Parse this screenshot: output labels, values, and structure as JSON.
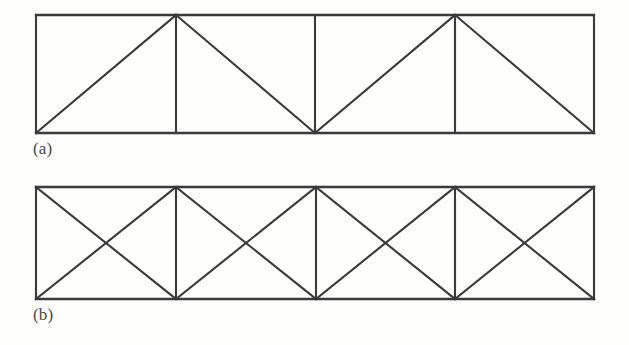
{
  "figure": {
    "background_color": "#fdfdfc",
    "line_color": "#3a3a3a",
    "line_width": 2.1,
    "caption_color": "#4a4a4a"
  },
  "diagrams": [
    {
      "id": "a",
      "caption": "(a)",
      "name": "warren-truss-with-verticals",
      "geometry": {
        "left": 36,
        "right": 594,
        "top": 15,
        "bottom": 133,
        "verticals_x": [
          176,
          315,
          455
        ],
        "panel_count": 4
      },
      "members": {
        "top_chord": [
          [
            36,
            15
          ],
          [
            594,
            15
          ]
        ],
        "bottom_chord": [
          [
            36,
            133
          ],
          [
            594,
            133
          ]
        ],
        "left_end_post": [
          [
            36,
            15
          ],
          [
            36,
            133
          ]
        ],
        "right_end_post": [
          [
            594,
            15
          ],
          [
            594,
            133
          ]
        ],
        "verticals": [
          [
            [
              176,
              15
            ],
            [
              176,
              133
            ]
          ],
          [
            [
              315,
              15
            ],
            [
              315,
              133
            ]
          ],
          [
            [
              455,
              15
            ],
            [
              455,
              133
            ]
          ]
        ],
        "diagonals": [
          [
            [
              36,
              133
            ],
            [
              176,
              15
            ]
          ],
          [
            [
              176,
              15
            ],
            [
              315,
              133
            ]
          ],
          [
            [
              315,
              133
            ],
            [
              455,
              15
            ]
          ],
          [
            [
              455,
              15
            ],
            [
              594,
              133
            ]
          ]
        ]
      }
    },
    {
      "id": "b",
      "caption": "(b)",
      "name": "cross-braced-truss",
      "geometry": {
        "left": 36,
        "right": 594,
        "top": 187,
        "bottom": 299,
        "verticals_x": [
          176,
          316,
          455
        ],
        "panel_count": 4
      },
      "members": {
        "top_chord": [
          [
            36,
            187
          ],
          [
            594,
            187
          ]
        ],
        "bottom_chord": [
          [
            36,
            299
          ],
          [
            594,
            299
          ]
        ],
        "left_end_post": [
          [
            36,
            187
          ],
          [
            36,
            299
          ]
        ],
        "right_end_post": [
          [
            594,
            187
          ],
          [
            594,
            299
          ]
        ],
        "verticals": [
          [
            [
              176,
              187
            ],
            [
              176,
              299
            ]
          ],
          [
            [
              316,
              187
            ],
            [
              316,
              299
            ]
          ],
          [
            [
              455,
              187
            ],
            [
              455,
              299
            ]
          ]
        ],
        "diagonals": [
          [
            [
              36,
              187
            ],
            [
              176,
              299
            ]
          ],
          [
            [
              36,
              299
            ],
            [
              176,
              187
            ]
          ],
          [
            [
              176,
              187
            ],
            [
              316,
              299
            ]
          ],
          [
            [
              176,
              299
            ],
            [
              316,
              187
            ]
          ],
          [
            [
              316,
              187
            ],
            [
              455,
              299
            ]
          ],
          [
            [
              316,
              299
            ],
            [
              455,
              187
            ]
          ],
          [
            [
              455,
              187
            ],
            [
              594,
              299
            ]
          ],
          [
            [
              455,
              299
            ],
            [
              594,
              187
            ]
          ]
        ]
      }
    }
  ]
}
